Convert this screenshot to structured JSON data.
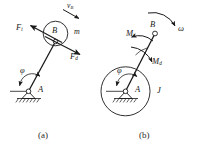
{
  "figure": {
    "background_color": "#ffffff",
    "stroke_color": "#1a1a1a"
  },
  "panels": [
    {
      "id": "a",
      "caption": "(a)",
      "description": "Rod AB pivoted at A with concentrated mass m at B",
      "labels": {
        "pivot": "A",
        "mass_point": "B",
        "mass": "m",
        "velocity": "v",
        "velocity_sub": "B",
        "force_tangential": "F",
        "force_tangential_sub": "t",
        "force_inertia": "F",
        "force_inertia_sub": "d",
        "angle": "φ"
      }
    },
    {
      "id": "b",
      "caption": "(b)",
      "description": "Equivalent rotor of moment of inertia J about A",
      "labels": {
        "pivot": "A",
        "end_point": "B",
        "inertia": "J",
        "angular_velocity": "ω",
        "moment_tangential": "M",
        "moment_tangential_sub": "t",
        "moment_inertia": "M",
        "moment_inertia_sub": "d",
        "angle": "φ"
      }
    }
  ]
}
